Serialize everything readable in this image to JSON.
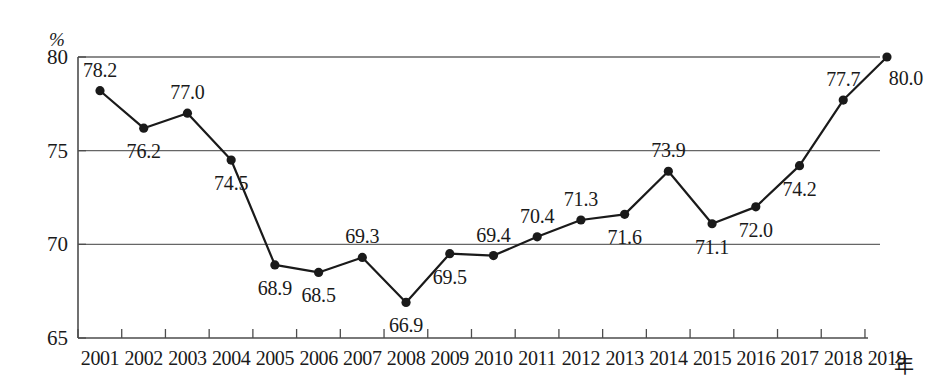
{
  "chart_data": {
    "type": "line",
    "title": "",
    "xlabel": "年",
    "ylabel": "%",
    "categories": [
      "2001",
      "2002",
      "2003",
      "2004",
      "2005",
      "2006",
      "2007",
      "2008",
      "2009",
      "2010",
      "2011",
      "2012",
      "2013",
      "2014",
      "2015",
      "2016",
      "2017",
      "2018",
      "2019"
    ],
    "values": [
      78.2,
      76.2,
      77.0,
      74.5,
      68.9,
      68.5,
      69.3,
      66.9,
      69.5,
      69.4,
      70.4,
      71.3,
      71.6,
      73.9,
      71.1,
      72.0,
      74.2,
      77.7,
      80.0
    ],
    "point_labels": [
      "78.2",
      "76.2",
      "77.0",
      "74.5",
      "68.9",
      "68.5",
      "69.3",
      "66.9",
      "69.5",
      "69.4",
      "70.4",
      "71.3",
      "71.6",
      "73.9",
      "71.1",
      "72.0",
      "74.2",
      "77.7",
      "80.0"
    ],
    "label_positions": [
      "above",
      "below",
      "above",
      "below",
      "below",
      "below",
      "above",
      "below",
      "below",
      "above",
      "above",
      "above",
      "below",
      "above",
      "below",
      "below",
      "below",
      "above",
      "below-right"
    ],
    "ylim": [
      65,
      80
    ],
    "yticks": [
      65,
      70,
      75,
      80
    ],
    "ytick_labels": [
      "65",
      "70",
      "75",
      "80"
    ],
    "gridlines": [
      70,
      75,
      80
    ],
    "grid": true,
    "legend": "none",
    "series_color": "#1a1a1a",
    "grid_color": "#666666",
    "marker": "filled-circle"
  }
}
